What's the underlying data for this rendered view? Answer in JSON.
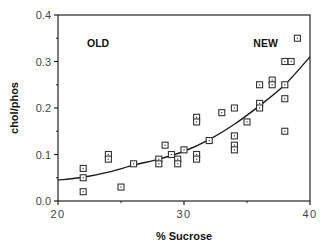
{
  "chart_data": {
    "type": "scatter",
    "title": "",
    "xlabel": "% Sucrose",
    "ylabel": "chol/phos",
    "xlim": [
      20,
      40
    ],
    "ylim": [
      0.0,
      0.4
    ],
    "x_ticks": [
      20,
      30,
      40
    ],
    "x_tick_labels": [
      "20",
      "30",
      "40"
    ],
    "x_minor_ticks": [
      25,
      35
    ],
    "y_ticks": [
      0.0,
      0.1,
      0.2,
      0.3,
      0.4
    ],
    "y_tick_labels": [
      "0.0",
      "0.1",
      "0.2",
      "0.3",
      "0.4"
    ],
    "y_minor_ticks": [
      0.05,
      0.15,
      0.25,
      0.35
    ],
    "grid": false,
    "legend": null,
    "annotations": [
      {
        "text": "OLD",
        "x": 22.3,
        "y": 0.34
      },
      {
        "text": "NEW",
        "x": 35.5,
        "y": 0.34
      }
    ],
    "series": [
      {
        "name": "observations",
        "marker": "square-dot",
        "points": [
          [
            22.0,
            0.07
          ],
          [
            22.0,
            0.05
          ],
          [
            22.0,
            0.02
          ],
          [
            24.0,
            0.1
          ],
          [
            24.0,
            0.09
          ],
          [
            25.0,
            0.03
          ],
          [
            26.0,
            0.08
          ],
          [
            28.0,
            0.09
          ],
          [
            28.0,
            0.08
          ],
          [
            28.5,
            0.12
          ],
          [
            29.0,
            0.1
          ],
          [
            29.5,
            0.09
          ],
          [
            29.5,
            0.08
          ],
          [
            30.0,
            0.11
          ],
          [
            31.0,
            0.18
          ],
          [
            31.0,
            0.17
          ],
          [
            31.0,
            0.1
          ],
          [
            31.0,
            0.09
          ],
          [
            32.0,
            0.13
          ],
          [
            33.0,
            0.19
          ],
          [
            34.0,
            0.2
          ],
          [
            34.0,
            0.14
          ],
          [
            34.0,
            0.12
          ],
          [
            34.0,
            0.11
          ],
          [
            35.0,
            0.17
          ],
          [
            36.0,
            0.25
          ],
          [
            36.0,
            0.21
          ],
          [
            36.0,
            0.2
          ],
          [
            37.0,
            0.26
          ],
          [
            37.0,
            0.25
          ],
          [
            38.0,
            0.3
          ],
          [
            38.5,
            0.3
          ],
          [
            38.0,
            0.25
          ],
          [
            38.0,
            0.22
          ],
          [
            38.0,
            0.15
          ],
          [
            39.0,
            0.35
          ]
        ]
      },
      {
        "name": "fitted curve",
        "type": "line",
        "points": [
          [
            20,
            0.045
          ],
          [
            22,
            0.051
          ],
          [
            24,
            0.062
          ],
          [
            26,
            0.077
          ],
          [
            28,
            0.09
          ],
          [
            30,
            0.107
          ],
          [
            32,
            0.132
          ],
          [
            34,
            0.165
          ],
          [
            36,
            0.205
          ],
          [
            38,
            0.25
          ],
          [
            40,
            0.31
          ]
        ]
      }
    ]
  },
  "colors": {
    "axis": "#222222",
    "marker": "#333333",
    "curve": "#1a1a1a",
    "text": "#111111"
  },
  "plot_box": {
    "left": 58,
    "right": 310,
    "top": 15,
    "bottom": 201
  }
}
